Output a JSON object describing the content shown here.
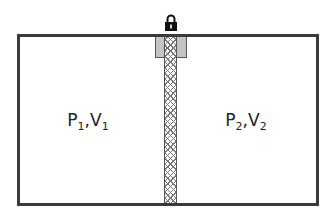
{
  "diagram": {
    "title": "",
    "compartments": [
      {
        "pressure": "P",
        "pressure_sub": "1",
        "sep": ",",
        "volume": "V",
        "volume_sub": "1"
      },
      {
        "pressure": "P",
        "pressure_sub": "2",
        "sep": ",",
        "volume": "V",
        "volume_sub": "2"
      }
    ],
    "icons": {
      "lock": "lock-icon"
    },
    "colors": {
      "border": "#3a3a3a",
      "seal": "#c4c4c4",
      "hatch": "#777777",
      "background": "#ffffff"
    }
  }
}
